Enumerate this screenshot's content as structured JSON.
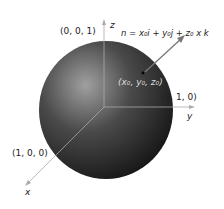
{
  "figure": {
    "axes": {
      "x_label": "x",
      "y_label": "y",
      "z_label": "z"
    },
    "points": {
      "z_intercept": "(0, 0, 1)",
      "y_intercept": "(0, 1, 0)",
      "x_intercept": "(1, 0, 0)",
      "surface_point": "(x₀, y₀, z₀)"
    },
    "normal_vector_label": "n = x₀i + y₀j + z₀ x k",
    "colors": {
      "sphere_light": "#9a9a9a",
      "sphere_dark": "#1a1a1a",
      "axis": "#aaaaaa",
      "normal_arrow": "#777777"
    }
  }
}
